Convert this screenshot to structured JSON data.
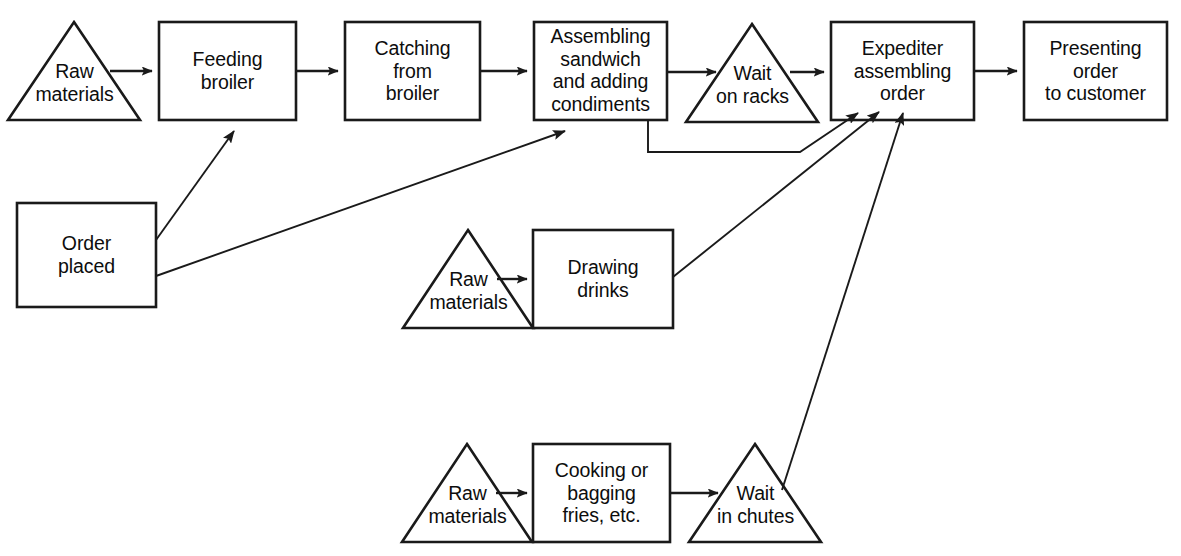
{
  "diagram": {
    "background_color": "#ffffff",
    "line_color": "#1a1a1a",
    "nodes": [
      {
        "id": "raw-materials-broiler",
        "shape": "triangle",
        "label": "Raw\nmaterials"
      },
      {
        "id": "feeding-broiler",
        "shape": "rectangle",
        "label": "Feeding\nbroiler"
      },
      {
        "id": "catching-from-broiler",
        "shape": "rectangle",
        "label": "Catching\nfrom\nbroiler"
      },
      {
        "id": "assembling-sandwich",
        "shape": "rectangle",
        "label": "Assembling\nsandwich\nand adding\ncondiments"
      },
      {
        "id": "wait-on-racks",
        "shape": "triangle",
        "label": "Wait\non racks"
      },
      {
        "id": "expediter-assembling-order",
        "shape": "rectangle",
        "label": "Expediter\nassembling\norder"
      },
      {
        "id": "presenting-order",
        "shape": "rectangle",
        "label": "Presenting\norder\nto customer"
      },
      {
        "id": "order-placed",
        "shape": "rectangle",
        "label": "Order\nplaced"
      },
      {
        "id": "raw-materials-drinks",
        "shape": "triangle",
        "label": "Raw\nmaterials"
      },
      {
        "id": "drawing-drinks",
        "shape": "rectangle",
        "label": "Drawing\ndrinks"
      },
      {
        "id": "raw-materials-fries",
        "shape": "triangle",
        "label": "Raw\nmaterials"
      },
      {
        "id": "cooking-bagging-fries",
        "shape": "rectangle",
        "label": "Cooking or\nbagging\nfries, etc."
      },
      {
        "id": "wait-in-chutes",
        "shape": "triangle",
        "label": "Wait\nin chutes"
      }
    ],
    "connections": [
      {
        "from": "raw-materials-broiler",
        "to": "feeding-broiler"
      },
      {
        "from": "feeding-broiler",
        "to": "catching-from-broiler"
      },
      {
        "from": "catching-from-broiler",
        "to": "assembling-sandwich"
      },
      {
        "from": "assembling-sandwich",
        "to": "wait-on-racks"
      },
      {
        "from": "wait-on-racks",
        "to": "expediter-assembling-order"
      },
      {
        "from": "expediter-assembling-order",
        "to": "presenting-order"
      },
      {
        "from": "order-placed",
        "to": "feeding-broiler"
      },
      {
        "from": "order-placed",
        "to": "assembling-sandwich"
      },
      {
        "from": "assembling-sandwich",
        "to": "expediter-assembling-order"
      },
      {
        "from": "raw-materials-drinks",
        "to": "drawing-drinks"
      },
      {
        "from": "drawing-drinks",
        "to": "expediter-assembling-order"
      },
      {
        "from": "raw-materials-fries",
        "to": "cooking-bagging-fries"
      },
      {
        "from": "cooking-bagging-fries",
        "to": "wait-in-chutes"
      },
      {
        "from": "wait-in-chutes",
        "to": "expediter-assembling-order"
      }
    ]
  }
}
